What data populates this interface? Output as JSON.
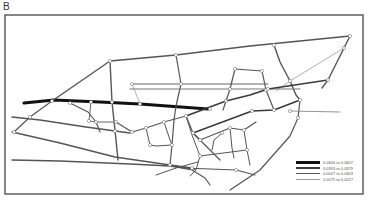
{
  "figure": {
    "panel_label": "B",
    "frame": {
      "x": 5,
      "y": 15,
      "w": 358,
      "h": 179,
      "stroke": "#555"
    },
    "colors": {
      "dark": "#111111",
      "mid": "#3a3a3a",
      "line": "#555555",
      "light": "#9a9a9a",
      "node": "#ffffff",
      "node_stroke": "#777777"
    }
  },
  "legend": {
    "items": [
      {
        "label": "0.0606 to 0.0607",
        "width": 3.2,
        "color": "#111111"
      },
      {
        "label": "0.0393 to 0.0379",
        "width": 2,
        "color": "#3a3a3a"
      },
      {
        "label": "0.0027 to 0.0303",
        "width": 1.4,
        "color": "#555555"
      },
      {
        "label": "0.0075 to 0.0227",
        "width": 0.8,
        "color": "#9a9a9a"
      }
    ]
  },
  "network": {
    "edges": [
      {
        "pts": [
          [
            24,
            103
          ],
          [
            54,
            100
          ],
          [
            100,
            102
          ],
          [
            140,
            104
          ],
          [
            208,
            109
          ]
        ],
        "w": 3.2,
        "c": "#111111"
      },
      {
        "pts": [
          [
            52,
            101
          ],
          [
            110,
            61
          ],
          [
            176,
            55
          ],
          [
            250,
            46
          ],
          [
            350,
            36
          ]
        ],
        "w": 1.4,
        "c": "#555555"
      },
      {
        "pts": [
          [
            110,
            61
          ],
          [
            112,
            102
          ],
          [
            116,
            140
          ],
          [
            118,
            160
          ]
        ],
        "w": 1.4,
        "c": "#555555"
      },
      {
        "pts": [
          [
            176,
            55
          ],
          [
            181,
            84
          ],
          [
            176,
            106
          ],
          [
            174,
            120
          ],
          [
            172,
            145
          ],
          [
            170,
            165
          ]
        ],
        "w": 1.2,
        "c": "#555555"
      },
      {
        "pts": [
          [
            132,
            84
          ],
          [
            181,
            84
          ],
          [
            268,
            84
          ]
        ],
        "w": 1.0,
        "c": "#666666"
      },
      {
        "pts": [
          [
            132,
            84
          ],
          [
            140,
            104
          ]
        ],
        "w": 0.8,
        "c": "#9a9a9a"
      },
      {
        "pts": [
          [
            350,
            36
          ],
          [
            344,
            48
          ],
          [
            328,
            80
          ],
          [
            322,
            88
          ]
        ],
        "w": 1.4,
        "c": "#555555"
      },
      {
        "pts": [
          [
            344,
            48
          ],
          [
            290,
            81
          ],
          [
            276,
            91
          ]
        ],
        "w": 0.8,
        "c": "#9a9a9a"
      },
      {
        "pts": [
          [
            274,
            45
          ],
          [
            280,
            62
          ],
          [
            290,
            81
          ],
          [
            296,
            95
          ],
          [
            300,
            100
          ]
        ],
        "w": 1.4,
        "c": "#555555"
      },
      {
        "pts": [
          [
            235,
            69
          ],
          [
            262,
            71
          ],
          [
            266,
            90
          ],
          [
            270,
            100
          ],
          [
            274,
            110
          ]
        ],
        "w": 1.2,
        "c": "#555555"
      },
      {
        "pts": [
          [
            235,
            69
          ],
          [
            230,
            89
          ],
          [
            226,
            101
          ],
          [
            223,
            110
          ]
        ],
        "w": 1.2,
        "c": "#555555"
      },
      {
        "pts": [
          [
            130,
            89
          ],
          [
            230,
            89
          ],
          [
            300,
            89
          ]
        ],
        "w": 1.0,
        "c": "#777777"
      },
      {
        "pts": [
          [
            186,
            116
          ],
          [
            226,
            101
          ],
          [
            250,
            95
          ],
          [
            268,
            89
          ],
          [
            328,
            80
          ]
        ],
        "w": 1.6,
        "c": "#3a3a3a"
      },
      {
        "pts": [
          [
            193,
            133
          ],
          [
            252,
            111
          ],
          [
            274,
            110
          ],
          [
            300,
            100
          ]
        ],
        "w": 1.6,
        "c": "#3a3a3a"
      },
      {
        "pts": [
          [
            300,
            100
          ],
          [
            298,
            118
          ],
          [
            290,
            136
          ],
          [
            260,
            170
          ],
          [
            230,
            190
          ]
        ],
        "w": 1.2,
        "c": "#555555"
      },
      {
        "pts": [
          [
            290,
            111
          ],
          [
            340,
            112
          ]
        ],
        "w": 0.9,
        "c": "#888888"
      },
      {
        "pts": [
          [
            12,
            117
          ],
          [
            40,
            120
          ],
          [
            86,
            127
          ],
          [
            115,
            131
          ],
          [
            130,
            133
          ]
        ],
        "w": 1.4,
        "c": "#555555"
      },
      {
        "pts": [
          [
            12,
            132
          ],
          [
            60,
            143
          ],
          [
            115,
            157
          ],
          [
            170,
            165
          ],
          [
            192,
            168
          ]
        ],
        "w": 1.4,
        "c": "#555555"
      },
      {
        "pts": [
          [
            12,
            160
          ],
          [
            60,
            161
          ],
          [
            130,
            164
          ],
          [
            170,
            166
          ],
          [
            195,
            169
          ]
        ],
        "w": 1.4,
        "c": "#555555"
      },
      {
        "pts": [
          [
            14,
            132
          ],
          [
            30,
            117
          ],
          [
            52,
            101
          ]
        ],
        "w": 1.2,
        "c": "#555555"
      },
      {
        "pts": [
          [
            70,
            103
          ],
          [
            88,
            112
          ],
          [
            96,
            122
          ],
          [
            100,
            132
          ]
        ],
        "w": 1.2,
        "c": "#555555"
      },
      {
        "pts": [
          [
            91,
            102
          ],
          [
            89,
            121
          ],
          [
            96,
            122
          ],
          [
            116,
            122
          ]
        ],
        "w": 1.0,
        "c": "#666666"
      },
      {
        "pts": [
          [
            116,
            122
          ],
          [
            132,
            132
          ],
          [
            146,
            128
          ],
          [
            164,
            122
          ],
          [
            186,
            116
          ]
        ],
        "w": 1.2,
        "c": "#555555"
      },
      {
        "pts": [
          [
            146,
            128
          ],
          [
            150,
            145
          ],
          [
            156,
            146
          ],
          [
            172,
            145
          ]
        ],
        "w": 1.0,
        "c": "#555555"
      },
      {
        "pts": [
          [
            164,
            122
          ],
          [
            170,
            140
          ],
          [
            172,
            145
          ]
        ],
        "w": 1.0,
        "c": "#555555"
      },
      {
        "pts": [
          [
            186,
            116
          ],
          [
            193,
            133
          ],
          [
            210,
            150
          ],
          [
            220,
            160
          ]
        ],
        "w": 1.2,
        "c": "#555555"
      },
      {
        "pts": [
          [
            193,
            133
          ],
          [
            200,
            140
          ],
          [
            230,
            128
          ],
          [
            244,
            130
          ],
          [
            256,
            122
          ]
        ],
        "w": 1.2,
        "c": "#555555"
      },
      {
        "pts": [
          [
            222,
            133
          ],
          [
            214,
            140
          ],
          [
            212,
            150
          ]
        ],
        "w": 1.0,
        "c": "#555555"
      },
      {
        "pts": [
          [
            230,
            128
          ],
          [
            232,
            148
          ],
          [
            234,
            158
          ]
        ],
        "w": 1.0,
        "c": "#555555"
      },
      {
        "pts": [
          [
            244,
            130
          ],
          [
            247,
            150
          ],
          [
            250,
            165
          ]
        ],
        "w": 1.0,
        "c": "#555555"
      },
      {
        "pts": [
          [
            200,
            156
          ],
          [
            247,
            150
          ]
        ],
        "w": 1.0,
        "c": "#555555"
      },
      {
        "pts": [
          [
            184,
            168
          ],
          [
            236,
            170
          ],
          [
            255,
            175
          ]
        ],
        "w": 1.2,
        "c": "#555555"
      },
      {
        "pts": [
          [
            170,
            166
          ],
          [
            192,
            170
          ],
          [
            205,
            178
          ],
          [
            210,
            185
          ]
        ],
        "w": 1.2,
        "c": "#555555"
      },
      {
        "pts": [
          [
            156,
            175
          ],
          [
            176,
            168
          ],
          [
            198,
            162
          ]
        ],
        "w": 1.0,
        "c": "#555555"
      },
      {
        "pts": [
          [
            186,
            116
          ],
          [
            192,
            135
          ],
          [
            200,
            156
          ],
          [
            196,
            170
          ],
          [
            190,
            176
          ]
        ],
        "w": 1.0,
        "c": "#555555"
      }
    ],
    "nodes": [
      [
        52,
        101
      ],
      [
        110,
        61
      ],
      [
        176,
        55
      ],
      [
        274,
        45
      ],
      [
        350,
        36
      ],
      [
        344,
        48
      ],
      [
        328,
        80
      ],
      [
        290,
        81
      ],
      [
        300,
        100
      ],
      [
        235,
        69
      ],
      [
        262,
        71
      ],
      [
        266,
        90
      ],
      [
        230,
        89
      ],
      [
        181,
        84
      ],
      [
        132,
        84
      ],
      [
        140,
        104
      ],
      [
        112,
        102
      ],
      [
        70,
        103
      ],
      [
        91,
        102
      ],
      [
        89,
        121
      ],
      [
        96,
        122
      ],
      [
        116,
        122
      ],
      [
        132,
        132
      ],
      [
        146,
        128
      ],
      [
        164,
        122
      ],
      [
        186,
        116
      ],
      [
        193,
        133
      ],
      [
        226,
        101
      ],
      [
        252,
        111
      ],
      [
        274,
        110
      ],
      [
        30,
        117
      ],
      [
        14,
        132
      ],
      [
        115,
        131
      ],
      [
        150,
        145
      ],
      [
        172,
        145
      ],
      [
        200,
        140
      ],
      [
        230,
        128
      ],
      [
        244,
        130
      ],
      [
        222,
        133
      ],
      [
        247,
        150
      ],
      [
        200,
        156
      ],
      [
        236,
        170
      ],
      [
        192,
        168
      ],
      [
        290,
        111
      ],
      [
        268,
        89
      ],
      [
        298,
        118
      ],
      [
        210,
        109
      ],
      [
        170,
        165
      ]
    ]
  }
}
